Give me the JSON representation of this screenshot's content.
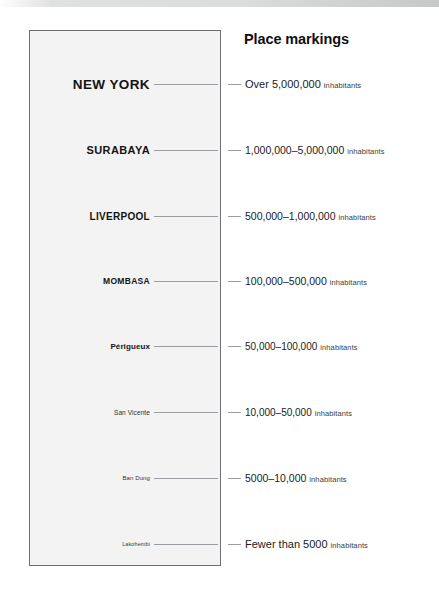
{
  "legend": {
    "title": "Place markings",
    "inhabitants_word": "inhabitants",
    "rows": [
      {
        "place": "NEW YORK",
        "population": "Over 5,000,000",
        "y": 84
      },
      {
        "place": "SURABAYA",
        "population": "1,000,000–5,000,000",
        "y": 150
      },
      {
        "place": "LIVERPOOL",
        "population": "500,000–1,000,000",
        "y": 216
      },
      {
        "place": "MOMBASA",
        "population": "100,000–500,000",
        "y": 281
      },
      {
        "place": "Périgueux",
        "population": "50,000–100,000",
        "y": 346
      },
      {
        "place": "San Vicente",
        "population": "10,000–50,000",
        "y": 412
      },
      {
        "place": "Ban Dung",
        "population": "5000–10,000",
        "y": 478
      },
      {
        "place": "Lakohembi",
        "population": "Fewer than 5000",
        "y": 544
      }
    ]
  },
  "colors": {
    "page_background": "#ffffff",
    "panel_fill": "#f3f3f3",
    "panel_border": "#6c6f73",
    "leader_line": "#9a9da1",
    "text_primary": "#141414",
    "text_secondary": "#3a3c3f"
  }
}
